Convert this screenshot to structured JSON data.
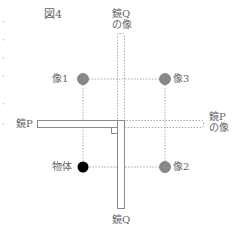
{
  "figure": {
    "title": "図4",
    "labels": {
      "mirror_q_image": [
        "鏡Q",
        "の像"
      ],
      "mirror_p_image": [
        "鏡P",
        "の像"
      ],
      "mirror_p": "鏡P",
      "mirror_q": "鏡Q",
      "image1": "像1",
      "image2": "像2",
      "image3": "像3",
      "object": "物体"
    },
    "left_edge_fragments": [
      "・",
      "・",
      "・",
      "・",
      "・",
      "・"
    ],
    "colors": {
      "object_fill": "#000000",
      "image_fill": "#888888",
      "line": "#9a9a9a",
      "dotted": "#aaaaaa"
    }
  }
}
